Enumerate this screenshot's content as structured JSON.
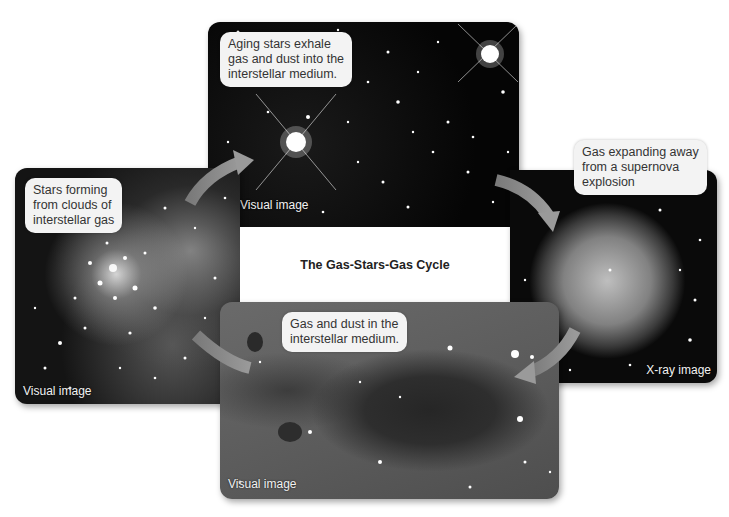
{
  "diagram": {
    "title": "The Gas-Stars-Gas Cycle",
    "panels": [
      {
        "id": "top",
        "callout": "Aging stars exhale gas and dust into the interstellar medium.",
        "callout_lines": [
          "Aging stars exhale",
          "gas and dust into the",
          "interstellar medium."
        ],
        "image_label": "Visual image"
      },
      {
        "id": "right",
        "callout": "Gas expanding away from a supernova explosion",
        "callout_lines": [
          "Gas expanding away",
          "from a supernova",
          "explosion"
        ],
        "image_label": "X-ray image"
      },
      {
        "id": "bottom",
        "callout": "Gas and dust in the interstellar medium.",
        "callout_lines": [
          "Gas and dust in the",
          "interstellar medium."
        ],
        "image_label": "Visual image"
      },
      {
        "id": "left",
        "callout": "Stars forming from clouds of interstellar gas",
        "callout_lines": [
          "Stars forming",
          "from clouds of",
          "interstellar gas"
        ],
        "image_label": "Visual image"
      }
    ],
    "cycle_order": [
      "left",
      "top",
      "right",
      "bottom",
      "left"
    ],
    "arrow_color": "#8a8a8a"
  }
}
